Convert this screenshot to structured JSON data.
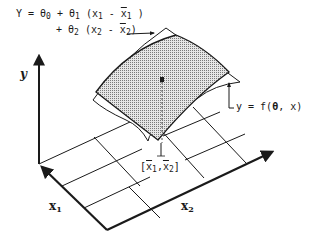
{
  "diagram": {
    "equation": {
      "line1_prefix": "Y = θ",
      "line1_sub0": "0",
      "line1_mid": " + θ",
      "line1_sub1": "1",
      "line1_paren": " (x",
      "line1_x1sub": "1",
      "line1_minus": " - ",
      "line1_xbar": "x",
      "line1_xbarsub": "1",
      "line1_close": " )",
      "line2_prefix": "+ θ",
      "line2_sub2": "2",
      "line2_paren": " (x",
      "line2_x2sub": "2",
      "line2_minus": " - ",
      "line2_xbar": "x",
      "line2_xbarsub": "2",
      "line2_close": ")"
    },
    "surface_label": {
      "text": "y = f(",
      "theta": "θ",
      "rest": ", x)"
    },
    "point_label": {
      "open": "[",
      "x1": "x",
      "x1sub": "1",
      "comma": ",",
      "x2": "x",
      "x2sub": "2",
      "close": "]"
    },
    "axes": {
      "y": "y",
      "x1": "x",
      "x1sub": "1",
      "x2": "x",
      "x2sub": "2"
    },
    "colors": {
      "ink": "#1a1a1a",
      "surface_fill": "#bdbdbd",
      "background": "#ffffff"
    }
  }
}
